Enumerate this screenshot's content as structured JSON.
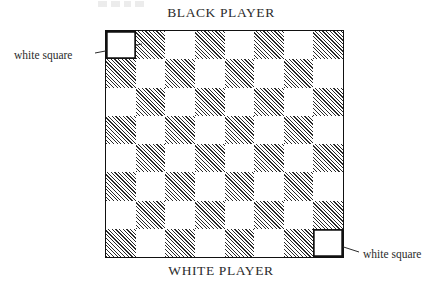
{
  "figure": {
    "top_player_label": "BLACK PLAYER",
    "bottom_player_label": "WHITE PLAYER",
    "callout_left_label": "white square",
    "callout_right_label": "white square"
  },
  "chart_data": {
    "type": "heatmap",
    "xlabel": "",
    "ylabel": "",
    "rows": 8,
    "columns": 8,
    "legend": [
      "white square",
      "hatched (black) square"
    ],
    "annotations": [
      {
        "text": "white square",
        "target_row": 1,
        "target_column": 1,
        "side": "left",
        "description": "leader line points to highlighted white square at top-left corner"
      },
      {
        "text": "white square",
        "target_row": 8,
        "target_column": 8,
        "side": "right",
        "description": "leader line points to highlighted white square at bottom-right corner"
      }
    ],
    "axis_labels": {
      "top": "BLACK PLAYER",
      "bottom": "WHITE PLAYER"
    },
    "colors": {
      "light_square": "#ffffff",
      "dark_square_hatch": "#2a2a2a",
      "border": "#111111",
      "text": "#2b2b2b"
    },
    "squares": [
      [
        "light",
        "dark",
        "light",
        "dark",
        "light",
        "dark",
        "light",
        "dark"
      ],
      [
        "dark",
        "light",
        "dark",
        "light",
        "dark",
        "light",
        "dark",
        "light"
      ],
      [
        "light",
        "dark",
        "light",
        "dark",
        "light",
        "dark",
        "light",
        "dark"
      ],
      [
        "dark",
        "light",
        "dark",
        "light",
        "dark",
        "light",
        "dark",
        "light"
      ],
      [
        "light",
        "dark",
        "light",
        "dark",
        "light",
        "dark",
        "light",
        "dark"
      ],
      [
        "dark",
        "light",
        "dark",
        "light",
        "dark",
        "light",
        "dark",
        "light"
      ],
      [
        "light",
        "dark",
        "light",
        "dark",
        "light",
        "dark",
        "light",
        "dark"
      ],
      [
        "dark",
        "light",
        "dark",
        "light",
        "dark",
        "light",
        "dark",
        "light"
      ]
    ],
    "highlighted": [
      {
        "row": 1,
        "column": 1
      },
      {
        "row": 8,
        "column": 8
      }
    ]
  }
}
